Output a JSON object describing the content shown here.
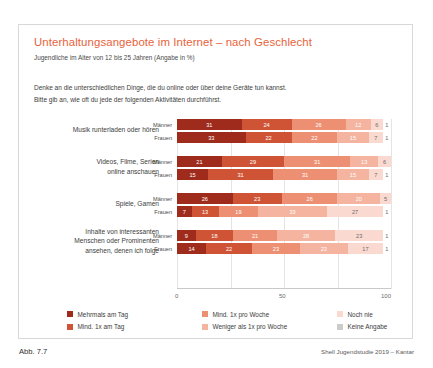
{
  "figure": {
    "title": "Unterhaltungsangebote im Internet – nach Geschlecht",
    "subtitle": "Jugendliche im Alter von 12 bis 25 Jahren (Angabe in %)",
    "question_line1": "Denke an die unterschiedlichen Dinge, die du online oder über deine Geräte tun kannst.",
    "question_line2": "Bitte gib an, wie oft du jede der folgenden Aktivitäten durchführst.",
    "figure_number": "Abb. 7.7",
    "source": "Shell Jugendstudie 2019 – Kantar",
    "title_color": "#e8623a"
  },
  "chart_data": {
    "type": "bar",
    "orientation": "horizontal",
    "stacked": true,
    "title": "Unterhaltungsangebote im Internet – nach Geschlecht",
    "subtitle": "Jugendliche im Alter von 12 bis 25 Jahren (Angabe in %)",
    "xlabel": "",
    "ylabel": "",
    "xlim": [
      0,
      100
    ],
    "xticks": [
      0,
      50,
      100
    ],
    "xticklabels": [
      "0",
      "50",
      "100"
    ],
    "grid": true,
    "legend_position": "bottom",
    "unit": "%",
    "series": [
      {
        "name": "Mehrmals am Tag",
        "color": "#9e2b1c"
      },
      {
        "name": "Mind. 1x am Tag",
        "color": "#cf5436"
      },
      {
        "name": "Mind. 1x pro Woche",
        "color": "#ed8f72"
      },
      {
        "name": "Weniger als 1x pro Woche",
        "color": "#f4b4a0"
      },
      {
        "name": "Noch nie",
        "color": "#fad9d0"
      },
      {
        "name": "Keine Angabe",
        "color": "#cbcbcb"
      }
    ],
    "groups": [
      {
        "category": "Musik runterladen oder hören",
        "category_lines": [
          "Musik runterladen oder hören"
        ],
        "rows": [
          {
            "label": "Männer",
            "values": [
              31,
              24,
              26,
              12,
              6,
              1
            ]
          },
          {
            "label": "Frauen",
            "values": [
              33,
              22,
              22,
              15,
              7,
              1
            ]
          }
        ]
      },
      {
        "category": "Videos, Filme, Serien online anschauen",
        "category_lines": [
          "Videos, Filme, Serien",
          "online anschauen"
        ],
        "rows": [
          {
            "label": "Männer",
            "values": [
              21,
              29,
              31,
              13,
              6,
              0
            ]
          },
          {
            "label": "Frauen",
            "values": [
              15,
              31,
              31,
              15,
              7,
              1
            ]
          }
        ]
      },
      {
        "category": "Spiele, Gamen",
        "category_lines": [
          "Spiele, Gamen"
        ],
        "rows": [
          {
            "label": "Männer",
            "values": [
              26,
              23,
              26,
              20,
              5,
              0
            ]
          },
          {
            "label": "Frauen",
            "values": [
              7,
              13,
              19,
              33,
              27,
              1
            ]
          }
        ]
      },
      {
        "category": "Inhalte von interessanten Menschen oder Prominenten ansehen, denen ich folge",
        "category_lines": [
          "Inhalte von interessanten",
          "Menschen oder Prominenten",
          "ansehen, denen ich folge"
        ],
        "rows": [
          {
            "label": "Männer",
            "values": [
              9,
              18,
              21,
              28,
              23,
              1
            ]
          },
          {
            "label": "Frauen",
            "values": [
              14,
              22,
              23,
              23,
              17,
              1
            ]
          }
        ]
      }
    ]
  },
  "legend": {
    "columns": [
      [
        {
          "label": "Mehrmals am Tag",
          "color": "#9e2b1c"
        },
        {
          "label": "Mind. 1x am Tag",
          "color": "#cf5436"
        }
      ],
      [
        {
          "label": "Mind. 1x pro Woche",
          "color": "#ed8f72"
        },
        {
          "label": "Weniger als 1x pro Woche",
          "color": "#f4b4a0"
        }
      ],
      [
        {
          "label": "Noch nie",
          "color": "#fad9d0"
        },
        {
          "label": "Keine Angabe",
          "color": "#cbcbcb"
        }
      ]
    ]
  }
}
